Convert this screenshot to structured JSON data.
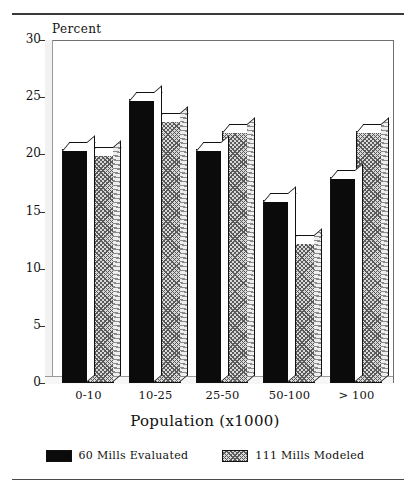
{
  "chart_data": {
    "type": "bar",
    "title": "",
    "xlabel": "Population (x1000)",
    "ylabel": "Percent",
    "ylim": [
      0,
      30
    ],
    "yticks": [
      0,
      5,
      10,
      15,
      20,
      25,
      30
    ],
    "ytick_labels": [
      "0",
      "5",
      "10",
      "15",
      "20",
      "25",
      "30"
    ],
    "grid": false,
    "legend_position": "bottom",
    "categories": [
      "0-10",
      "10-25",
      "25-50",
      "50-100",
      "> 100"
    ],
    "series": [
      {
        "name": "60 Mills Evaluated",
        "style": "solid-black",
        "values": [
          20.5,
          24.8,
          20.5,
          16.0,
          18.0
        ]
      },
      {
        "name": "111 Mills Modeled",
        "style": "gray-crosshatch",
        "values": [
          20.0,
          23.0,
          22.0,
          12.3,
          22.0
        ]
      }
    ]
  },
  "axes": {
    "y_title": "Percent",
    "x_title": "Population (x1000)"
  },
  "legend": {
    "items": [
      {
        "label": "60 Mills Evaluated",
        "swatch": "solid-black-swatch"
      },
      {
        "label": "111 Mills Modeled",
        "swatch": "hatched-gray-swatch"
      }
    ]
  },
  "colors": {
    "series_1": "#0b0b0b",
    "series_2": "#d9d9d9",
    "axis": "#333333",
    "frame": "#6f6f6f",
    "rule": "#3a3a3a",
    "background": "#ffffff"
  }
}
